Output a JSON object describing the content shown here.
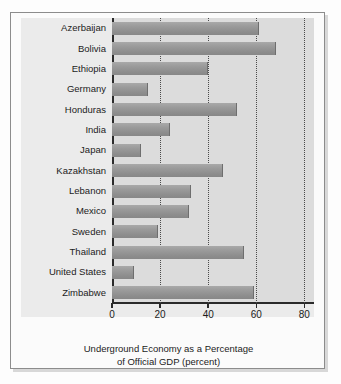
{
  "chart_data": {
    "type": "bar",
    "orientation": "horizontal",
    "title": "",
    "caption_line1": "Underground Economy as a Percentage",
    "caption_line2": "of Official GDP (percent)",
    "xlabel": "Underground Economy as a Percentage of Official GDP (percent)",
    "ylabel": "",
    "xlim": [
      0,
      84
    ],
    "ylim": null,
    "grid": "vertical dotted gridlines at 20, 40, 60, 80",
    "legend": "none",
    "xticks": [
      0,
      20,
      40,
      60,
      80
    ],
    "xtick_labels": [
      "0",
      "20",
      "40",
      "60",
      "80"
    ],
    "categories": [
      "Azerbaijan",
      "Bolivia",
      "Ethiopia",
      "Germany",
      "Honduras",
      "India",
      "Japan",
      "Kazakhstan",
      "Lebanon",
      "Mexico",
      "Sweden",
      "Thailand",
      "United States",
      "Zimbabwe"
    ],
    "values": [
      61,
      68,
      40,
      15,
      52,
      24,
      12,
      46,
      33,
      32,
      19,
      55,
      9,
      59
    ],
    "bars": [
      {
        "label": "Azerbaijan",
        "value": 61
      },
      {
        "label": "Bolivia",
        "value": 68
      },
      {
        "label": "Ethiopia",
        "value": 40
      },
      {
        "label": "Germany",
        "value": 15
      },
      {
        "label": "Honduras",
        "value": 52
      },
      {
        "label": "India",
        "value": 24
      },
      {
        "label": "Japan",
        "value": 12
      },
      {
        "label": "Kazakhstan",
        "value": 46
      },
      {
        "label": "Lebanon",
        "value": 33
      },
      {
        "label": "Mexico",
        "value": 32
      },
      {
        "label": "Sweden",
        "value": 19
      },
      {
        "label": "Thailand",
        "value": 55
      },
      {
        "label": "United States",
        "value": 9
      },
      {
        "label": "Zimbabwe",
        "value": 59
      }
    ],
    "colors": {
      "bar_fill": "#9a9a9a",
      "bar_edge": "#6e6e6e",
      "plot_background": "#dcdcdc",
      "panel_background": "#ebebeb",
      "axis": "#2a2a2a",
      "gridline": "#4a4a4a",
      "text": "#1c1c1c",
      "frame_border": "#8c8c8c",
      "page_background": "#fdfdfd"
    }
  }
}
